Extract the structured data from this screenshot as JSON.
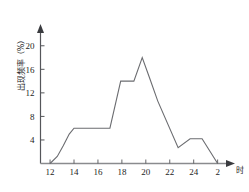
{
  "chart_data": {
    "type": "line",
    "title": "",
    "xlabel": "时",
    "ylabel": "出现频率（%）",
    "xlim": [
      11.2,
      3.0
    ],
    "ylim": [
      0,
      22
    ],
    "grid": false,
    "legend": null,
    "x_ticks": [
      "12",
      "14",
      "16",
      "18",
      "20",
      "22",
      "24",
      "2"
    ],
    "x_tick_values": [
      12,
      14,
      16,
      18,
      20,
      22,
      24,
      26
    ],
    "y_ticks": [
      "4",
      "8",
      "12",
      "16",
      "20"
    ],
    "y_tick_values": [
      4,
      8,
      12,
      16,
      20
    ],
    "series": [
      {
        "name": "出现频率",
        "x": [
          12.0,
          12.6,
          13.1,
          13.6,
          14.0,
          17.0,
          17.9,
          19.0,
          19.7,
          20.3,
          21.0,
          22.7,
          23.7,
          24.7,
          26.0
        ],
        "values": [
          0.0,
          1.2,
          3.0,
          5.0,
          6.0,
          6.0,
          14.0,
          14.0,
          18.0,
          14.6,
          10.6,
          2.7,
          4.2,
          4.2,
          0.0
        ]
      }
    ]
  },
  "axis": {
    "y_axis_title": "出现频率（%）",
    "x_axis_title": "时"
  }
}
